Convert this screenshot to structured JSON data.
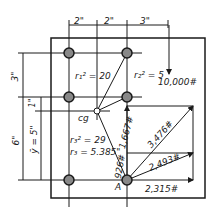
{
  "dimensions": {
    "top": [
      "2\"",
      "2\"",
      "3\""
    ],
    "left_outer_top": "3\"",
    "left_inner_small": "1\"",
    "left_outer_bottom": "6\"",
    "ybar": "ȳ = 5\""
  },
  "labels": {
    "r1": "r₁² = 20",
    "r2": "r₂² = 5",
    "r3sq": "r₃² = 29",
    "r3": "r₃ = 5.385\"",
    "cg": "cg",
    "load": "10,000#",
    "point_a": "A"
  },
  "forces": {
    "vertical_1667": "1,667#",
    "vertical_926": "926#",
    "diag_3476": "3,476#",
    "diag_2493": "2,493#",
    "horiz_2315": "2,315#"
  },
  "colors": {
    "ink": "#1a1a1a",
    "background": "#ffffff"
  }
}
